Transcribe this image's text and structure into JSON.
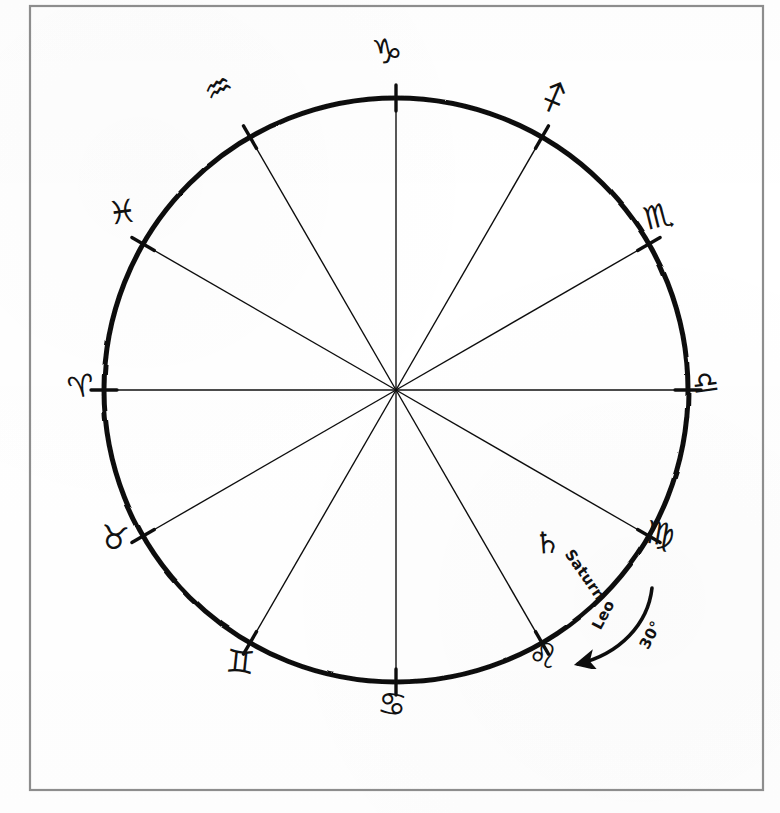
{
  "document": {
    "kind": "hand-drawn zodiac wheel diagram",
    "background_color": "#ffffff",
    "ink_color": "#111111",
    "frame_color": "#8d8d8d"
  },
  "frame": {
    "x": 30,
    "y": 6,
    "width": 733,
    "height": 784
  },
  "wheel": {
    "center_x": 396,
    "center_y": 390,
    "radius": 292,
    "rim_stroke_width": 5,
    "spoke_stroke_width": 1.4,
    "tick_stroke_width": 3.4,
    "tick_length": 26,
    "spoke_count": 12,
    "degrees_per_sector": 30
  },
  "signs": [
    {
      "name": "Aries",
      "glyph": "♈",
      "boundary_degrees": 180,
      "label_x": 68,
      "label_y": 372,
      "rotate": -12,
      "size": 30
    },
    {
      "name": "Pisces",
      "glyph": "♓",
      "boundary_degrees": 150,
      "label_x": 108,
      "label_y": 196,
      "rotate": -8,
      "size": 32
    },
    {
      "name": "Aquarius",
      "glyph": "♒",
      "boundary_degrees": 120,
      "label_x": 204,
      "label_y": 72,
      "rotate": -28,
      "size": 32
    },
    {
      "name": "Capricorn",
      "glyph": "♑",
      "boundary_degrees": 90,
      "label_x": 372,
      "label_y": 34,
      "rotate": -6,
      "size": 34
    },
    {
      "name": "Sagittarius",
      "glyph": "♐",
      "boundary_degrees": 60,
      "label_x": 540,
      "label_y": 82,
      "rotate": -22,
      "size": 32
    },
    {
      "name": "Scorpio",
      "glyph": "♏",
      "boundary_degrees": 30,
      "label_x": 644,
      "label_y": 200,
      "rotate": -14,
      "size": 32
    },
    {
      "name": "Libra",
      "glyph": "♎",
      "boundary_degrees": 0,
      "label_x": 692,
      "label_y": 368,
      "rotate": -8,
      "size": 30
    },
    {
      "name": "Virgo",
      "glyph": "♍",
      "boundary_degrees": 330,
      "label_x": 646,
      "label_y": 518,
      "rotate": 10,
      "size": 32
    },
    {
      "name": "Leo",
      "glyph": "♌",
      "boundary_degrees": 300,
      "label_x": 528,
      "label_y": 638,
      "rotate": 10,
      "size": 34
    },
    {
      "name": "Cancer",
      "glyph": "♋",
      "boundary_degrees": 270,
      "label_x": 378,
      "label_y": 688,
      "rotate": 8,
      "size": 32
    },
    {
      "name": "Gemini",
      "glyph": "♊",
      "boundary_degrees": 240,
      "label_x": 226,
      "label_y": 646,
      "rotate": 6,
      "size": 32
    },
    {
      "name": "Taurus",
      "glyph": "♉",
      "boundary_degrees": 210,
      "label_x": 100,
      "label_y": 522,
      "rotate": 8,
      "size": 32
    }
  ],
  "annotations": {
    "saturn": {
      "glyph": "♄",
      "label": "Saturn",
      "glyph_x": 534,
      "glyph_y": 528,
      "glyph_rotate": -4,
      "label_x": 556,
      "label_y": 566,
      "label_rotate": 55
    },
    "leo_arrow": {
      "label": "Leo",
      "degrees_label": "30°",
      "label_x": 588,
      "label_y": 606,
      "label_rotate": -62,
      "degrees_x": 636,
      "degrees_y": 626,
      "degrees_rotate": -62,
      "arrow_from_x": 648,
      "arrow_from_y": 592,
      "arrow_to_x": 572,
      "arrow_to_y": 660
    }
  }
}
